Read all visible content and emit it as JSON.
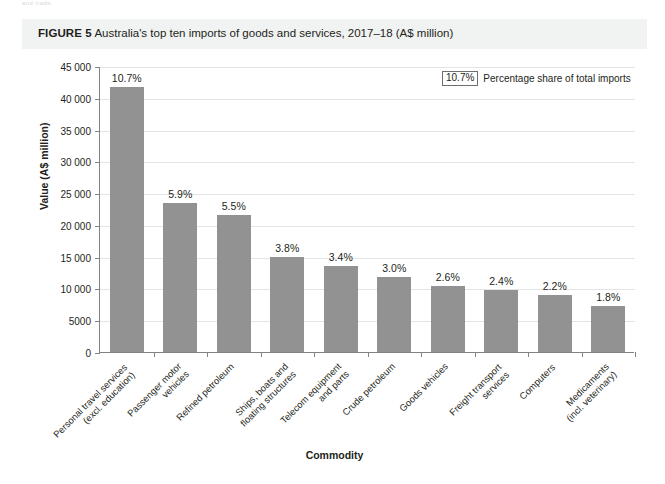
{
  "page": {
    "bleed_text": "and trade."
  },
  "figure": {
    "label": "FIGURE 5",
    "caption": "Australia's top ten imports of goods and services, 2017–18 (A$ million)"
  },
  "legend": {
    "swatch_value": "10.7%",
    "text": "Percentage share of total imports"
  },
  "axes": {
    "y_title": "Value (A$ million)",
    "x_title": "Commodity",
    "y_ticks": [
      "45 000",
      "40 000",
      "35 000",
      "30 000",
      "25 000",
      "20 000",
      "15 000",
      "10 000",
      "5000",
      "0"
    ]
  },
  "chart_data": {
    "type": "bar",
    "title": "Australia's top ten imports of goods and services, 2017–18 (A$ million)",
    "xlabel": "Commodity",
    "ylabel": "Value (A$ million)",
    "ylim": [
      0,
      45000
    ],
    "ytick_step": 5000,
    "grid": true,
    "legend_position": "top-right",
    "bar_color": "#929292",
    "categories": [
      "Personal travel services (excl. education)",
      "Passenger motor vehicles",
      "Refined petroleum",
      "Ships, boats and floating structures",
      "Telecom equipment and parts",
      "Crude petroleum",
      "Goods vehicles",
      "Freight transport services",
      "Computers",
      "Medicaments (incl. veterinary)"
    ],
    "category_lines": [
      [
        "Personal travel services",
        "(excl. education)"
      ],
      [
        "Passenger motor",
        "vehicles"
      ],
      [
        "Refined petroleum"
      ],
      [
        "Ships, boats and",
        "floating structures"
      ],
      [
        "Telecom equipment",
        "and parts"
      ],
      [
        "Crude petroleum"
      ],
      [
        "Goods vehicles"
      ],
      [
        "Freight transport",
        "services"
      ],
      [
        "Computers"
      ],
      [
        "Medicaments",
        "(incl. veterinary)"
      ]
    ],
    "values": [
      41700,
      23400,
      21600,
      14900,
      13600,
      11800,
      10400,
      9700,
      9000,
      7200
    ],
    "data_labels": [
      "10.7%",
      "5.9%",
      "5.5%",
      "3.8%",
      "3.4%",
      "3.0%",
      "2.6%",
      "2.4%",
      "2.2%",
      "1.8%"
    ],
    "value_unit": "A$ million",
    "data_label_meaning": "Percentage share of total imports"
  }
}
